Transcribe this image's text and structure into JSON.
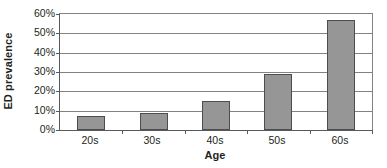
{
  "chart_data": {
    "type": "bar",
    "title": "",
    "xlabel": "Age",
    "ylabel": "ED prevalence",
    "categories": [
      "20s",
      "30s",
      "40s",
      "50s",
      "60s"
    ],
    "values": [
      7,
      9,
      15,
      29,
      57
    ],
    "value_suffix": "%",
    "ylim": [
      0,
      60
    ],
    "ytick_step": 10,
    "ytick_labels": [
      "60%",
      "50%",
      "40%",
      "30%",
      "20%",
      "10%",
      "0%"
    ],
    "ytick_values": [
      60,
      50,
      40,
      30,
      20,
      10,
      0
    ],
    "grid": "horizontal",
    "legend": "none",
    "series": [
      {
        "name": "ED prevalence",
        "values": [
          7,
          9,
          15,
          29,
          57
        ],
        "bar_color": "#969696",
        "bar_border_color": "#4d4d4d"
      }
    ],
    "colors": {
      "bar_fill": "#969696",
      "bar_border": "#4d4d4d",
      "gridline": "#808285",
      "axis_line": "#58595b",
      "text": "#231f20",
      "plot_background": "#ffffff"
    }
  }
}
